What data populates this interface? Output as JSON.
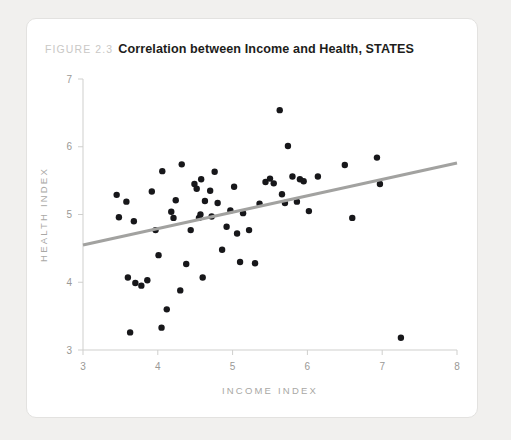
{
  "figure": {
    "number": "FIGURE 2.3",
    "title": "Correlation between Income and Health, STATES"
  },
  "colors": {
    "page_background": "#f1f0ee",
    "card_background": "#ffffff",
    "card_border": "#e3e2e0",
    "point": "#17171a",
    "trend_line": "#a2a2a0",
    "axis": "#cfcfcd",
    "tick_label": "#9a9996",
    "axis_title": "#a9a8a5",
    "caption_number": "#c9c8c6",
    "caption_title": "#1d1d1b"
  },
  "chart_data": {
    "type": "scatter",
    "title": "Correlation between Income and Health, STATES",
    "xlabel": "INCOME INDEX",
    "ylabel": "HEALTH INDEX",
    "xlim": [
      3,
      8
    ],
    "ylim": [
      3,
      7
    ],
    "xticks": [
      3,
      4,
      5,
      6,
      7,
      8
    ],
    "yticks": [
      3,
      4,
      5,
      6,
      7
    ],
    "xtick_labels": [
      "3",
      "4",
      "5",
      "6",
      "7",
      "8"
    ],
    "ytick_labels": [
      "3",
      "4",
      "5",
      "6",
      "7"
    ],
    "grid": false,
    "legend": false,
    "n_points": 58,
    "points": [
      [
        3.45,
        5.29
      ],
      [
        3.48,
        4.96
      ],
      [
        3.58,
        5.19
      ],
      [
        3.6,
        4.07
      ],
      [
        3.63,
        3.26
      ],
      [
        3.68,
        4.9
      ],
      [
        3.7,
        3.99
      ],
      [
        3.78,
        3.95
      ],
      [
        3.86,
        4.03
      ],
      [
        3.92,
        5.34
      ],
      [
        3.97,
        4.77
      ],
      [
        4.01,
        4.4
      ],
      [
        4.05,
        3.33
      ],
      [
        4.06,
        5.64
      ],
      [
        4.12,
        3.6
      ],
      [
        4.18,
        5.04
      ],
      [
        4.21,
        4.95
      ],
      [
        4.24,
        5.21
      ],
      [
        4.3,
        3.88
      ],
      [
        4.32,
        5.74
      ],
      [
        4.38,
        4.27
      ],
      [
        4.44,
        4.77
      ],
      [
        4.49,
        5.45
      ],
      [
        4.52,
        5.38
      ],
      [
        4.55,
        4.95
      ],
      [
        4.57,
        5.0
      ],
      [
        4.58,
        5.52
      ],
      [
        4.6,
        4.07
      ],
      [
        4.63,
        5.2
      ],
      [
        4.7,
        5.35
      ],
      [
        4.72,
        4.97
      ],
      [
        4.76,
        5.63
      ],
      [
        4.8,
        5.17
      ],
      [
        4.86,
        4.48
      ],
      [
        4.92,
        4.82
      ],
      [
        4.97,
        5.06
      ],
      [
        5.02,
        5.41
      ],
      [
        5.06,
        4.72
      ],
      [
        5.1,
        4.3
      ],
      [
        5.14,
        5.02
      ],
      [
        5.22,
        4.77
      ],
      [
        5.3,
        4.28
      ],
      [
        5.36,
        5.16
      ],
      [
        5.44,
        5.48
      ],
      [
        5.5,
        5.53
      ],
      [
        5.55,
        5.46
      ],
      [
        5.63,
        6.54
      ],
      [
        5.66,
        5.3
      ],
      [
        5.7,
        5.17
      ],
      [
        5.74,
        6.01
      ],
      [
        5.8,
        5.56
      ],
      [
        5.86,
        5.19
      ],
      [
        5.9,
        5.52
      ],
      [
        5.95,
        5.49
      ],
      [
        6.02,
        5.05
      ],
      [
        6.14,
        5.56
      ],
      [
        6.5,
        5.73
      ],
      [
        6.6,
        4.95
      ],
      [
        6.93,
        5.84
      ],
      [
        6.97,
        5.45
      ],
      [
        7.25,
        3.18
      ]
    ],
    "trend_line": {
      "x": [
        3.0,
        8.0
      ],
      "y": [
        4.55,
        5.76
      ]
    }
  }
}
